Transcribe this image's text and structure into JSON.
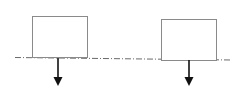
{
  "diagram": {
    "type": "two-blocks-on-axis-with-downward-forces",
    "colors": {
      "box_stroke": "#8a8a8a",
      "axis": "#6a6a6a",
      "arrow": "#111111",
      "background": "#ffffff"
    },
    "axis": {
      "style": "dash-dot",
      "x1": 15,
      "y1": 57,
      "x2": 232,
      "y2": 60
    },
    "blocks": [
      {
        "name": "left-block",
        "x": 32,
        "y": 16,
        "width": 55,
        "height": 41
      },
      {
        "name": "right-block",
        "x": 161,
        "y": 19,
        "width": 55,
        "height": 41
      }
    ],
    "arrows": [
      {
        "name": "left-force-arrow",
        "x": 58,
        "y_start": 58,
        "y_end": 86,
        "direction": "down"
      },
      {
        "name": "right-force-arrow",
        "x": 189,
        "y_start": 60,
        "y_end": 86,
        "direction": "down"
      }
    ]
  }
}
